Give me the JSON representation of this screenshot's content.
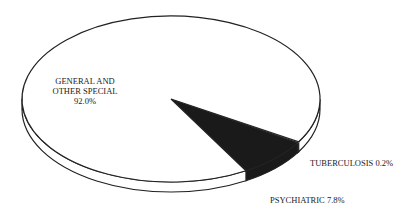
{
  "chart_data": {
    "type": "pie",
    "style": "3d",
    "title": "",
    "slices": [
      {
        "label": "GENERAL AND OTHER SPECIAL",
        "value": 92.0,
        "display": "92.0%",
        "fill": "#ffffff"
      },
      {
        "label": "PSYCHIATRIC",
        "value": 7.8,
        "display": "7.8%",
        "fill": "#1a1a1a"
      },
      {
        "label": "TUBERCULOSIS",
        "value": 0.2,
        "display": "0.2%",
        "fill": "#1a1a1a"
      }
    ],
    "labels": {
      "general_line1": "GENERAL AND",
      "general_line2": "OTHER SPECIAL",
      "general_value": "92.0%",
      "tuberculosis": "TUBERCULOSIS 0.2%",
      "psychiatric": "PSYCHIATRIC 7.8%"
    }
  }
}
